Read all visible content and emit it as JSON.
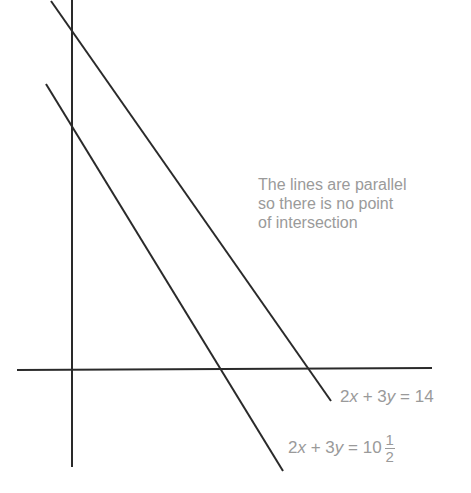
{
  "diagram": {
    "colors": {
      "lines": "#2a2a2a",
      "text": "#9a9a9a",
      "background": "#ffffff"
    },
    "axes": {
      "x_axis": {
        "x1": 17,
        "y1": 370,
        "x2": 432,
        "y2": 368
      },
      "y_axis": {
        "x1": 72,
        "y1": 0,
        "x2": 72,
        "y2": 467
      }
    },
    "lines": [
      {
        "id": "line-14",
        "equation": "2x + 3y = 14",
        "x1": 51,
        "y1": 1,
        "x2": 331,
        "y2": 401
      },
      {
        "id": "line-10-5",
        "equation": "2x + 3y = 10 1/2",
        "x1": 46,
        "y1": 84,
        "x2": 283,
        "y2": 471
      }
    ],
    "annotation": {
      "lines": [
        "The lines are parallel",
        "so there is no point",
        "of intersection"
      ]
    },
    "labels": {
      "eq1": {
        "a": "2",
        "v1": "x",
        "op1": " + 3",
        "v2": "y",
        "rest": " = 14"
      },
      "eq2": {
        "a": "2",
        "v1": "x",
        "op1": " + 3",
        "v2": "y",
        "rest": " = 10",
        "frac_num": "1",
        "frac_den": "2"
      }
    }
  }
}
